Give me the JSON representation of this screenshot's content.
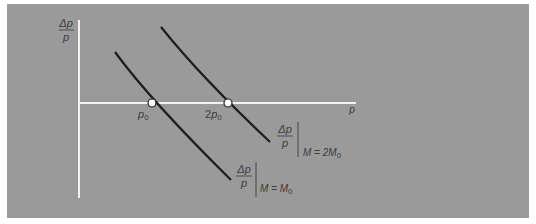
{
  "diagram": {
    "y_axis_label": {
      "numerator": "Δp",
      "denominator": "p"
    },
    "x_axis_label": "p",
    "x_ticks": [
      {
        "base": "p",
        "sub": "0",
        "prefix": ""
      },
      {
        "base": "p",
        "sub": "0",
        "prefix": "2"
      }
    ],
    "curves": [
      {
        "name": "M = M0",
        "label_numerator": "Δp",
        "label_denominator": "p",
        "condition_prefix": "M = M",
        "condition_sub": "0",
        "crosses_axis_at": "p0"
      },
      {
        "name": "M = 2M0",
        "label_numerator": "Δp",
        "label_denominator": "p",
        "condition_prefix": "M = 2M",
        "condition_sub": "0",
        "crosses_axis_at": "2p0"
      }
    ],
    "colors": {
      "background": "#9a9a9a",
      "axis": "#f2f2f2",
      "curve": "#1e1e1e",
      "text": "#3a3a3a",
      "marker_fill": "#ffffff"
    }
  }
}
